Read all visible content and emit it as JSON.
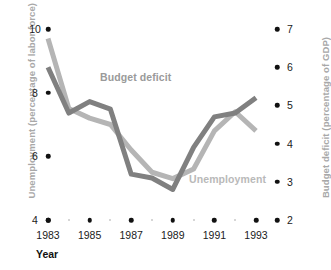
{
  "axes": {
    "y_left_title": "Unemployment (percentage of labor force)",
    "y_right_title": "Budget deficit (percentage of GDP)",
    "x_title": "Year"
  },
  "series_labels": {
    "budget_deficit": "Budget deficit",
    "unemployment": "Unemployment"
  },
  "colors": {
    "budget_deficit_line": "#808080",
    "unemployment_line": "#b5b5b5",
    "axis_title": "#a8a8a8",
    "tick": "#111111"
  },
  "chart_data": {
    "type": "line",
    "title": "",
    "xlabel": "Year",
    "grid": false,
    "legend": "inline-labels",
    "x": [
      1983,
      1984,
      1985,
      1986,
      1987,
      1988,
      1989,
      1990,
      1991,
      1992,
      1993
    ],
    "x_tick_labels": [
      "1983",
      "1985",
      "1987",
      "1989",
      "1991",
      "1993"
    ],
    "x_major_ticks": [
      1983,
      1985,
      1987,
      1989,
      1991,
      1993
    ],
    "x_minor_ticks": [
      1984,
      1986,
      1988,
      1990,
      1992
    ],
    "y_left": {
      "label": "Unemployment (percentage of labor force)",
      "ticks": [
        4,
        6,
        8,
        10
      ],
      "ylim": [
        4,
        10
      ]
    },
    "y_right": {
      "label": "Budget deficit (percentage of GDP)",
      "ticks": [
        2,
        3,
        4,
        5,
        6,
        7
      ],
      "ylim": [
        2,
        7
      ]
    },
    "series": [
      {
        "name": "Unemployment",
        "axis": "left",
        "unit": "percentage of labor force",
        "color": "#b5b5b5",
        "values": [
          9.7,
          7.5,
          7.2,
          7.0,
          6.2,
          5.5,
          5.3,
          5.6,
          6.8,
          7.4,
          6.8
        ]
      },
      {
        "name": "Budget deficit",
        "axis": "right",
        "unit": "percentage of GDP",
        "color": "#808080",
        "values": [
          6.0,
          4.8,
          5.1,
          4.9,
          3.2,
          3.1,
          2.8,
          3.9,
          4.7,
          4.8,
          5.2
        ]
      }
    ]
  }
}
